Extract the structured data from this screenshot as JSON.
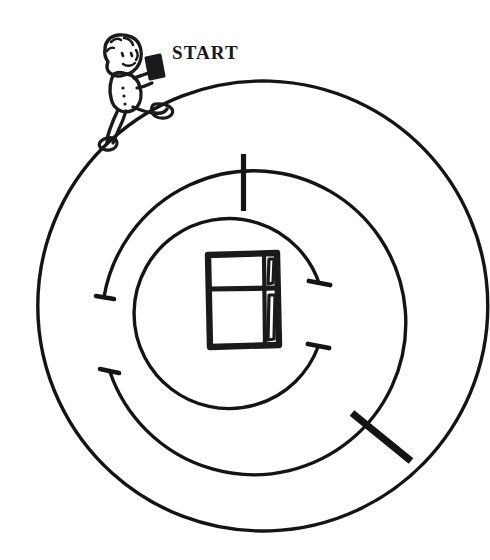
{
  "puzzle": {
    "title": "START",
    "type": "circular-maze",
    "ink_color": "#141416",
    "background_color": "#ffffff",
    "labels": {
      "start": "START"
    },
    "figure": {
      "name": "running-child-with-box",
      "position": "top-left",
      "carrying": "box"
    },
    "goal": {
      "name": "refrigerator",
      "position": "center",
      "description": "two-door refrigerator with freezer on top"
    },
    "geometry": {
      "center_x": 245,
      "center_y": 306,
      "outer_radius": 225,
      "middle_radius": 152,
      "inner_radius": 95,
      "stroke_thin": 3.2,
      "stroke_thick": 7
    },
    "walls": {
      "outer_ring_gap_top_left": true,
      "middle_ring_gaps": 2,
      "inner_ring_gaps": 2,
      "radial_wall_top": true,
      "radial_wall_bottom_right": true
    }
  }
}
